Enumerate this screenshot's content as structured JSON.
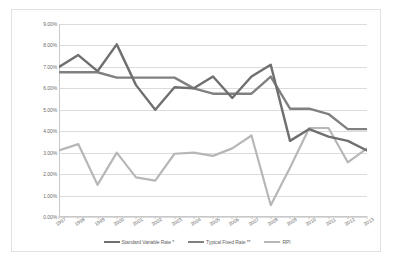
{
  "chart_data": {
    "type": "line",
    "title": "",
    "xlabel": "",
    "ylabel": "",
    "ylim": [
      0,
      9
    ],
    "ytick_labels": [
      "9.00%",
      "8.00%",
      "7.00%",
      "6.00%",
      "5.00%",
      "4.00%",
      "3.00%",
      "2.00%",
      "1.00%",
      "0.00%"
    ],
    "ytick_values": [
      9,
      8,
      7,
      6,
      5,
      4,
      3,
      2,
      1,
      0
    ],
    "grid": "horizontal",
    "legend_position": "bottom",
    "categories": [
      "1997",
      "1998",
      "1999",
      "2000",
      "2001",
      "2002",
      "2003",
      "2004",
      "2005",
      "2006",
      "2007",
      "2008",
      "2009",
      "2010",
      "2011",
      "2012",
      "2013"
    ],
    "series": [
      {
        "name": "Standard Variable Rate *",
        "color": "#6f6f6f",
        "values": [
          7.0,
          7.55,
          6.8,
          8.05,
          6.15,
          5.0,
          6.05,
          6.0,
          6.55,
          5.55,
          6.55,
          7.1,
          3.55,
          4.1,
          3.75,
          3.55,
          3.1
        ]
      },
      {
        "name": "Typical Fixed Rate **",
        "color": "#808080",
        "values": [
          6.75,
          6.75,
          6.75,
          6.5,
          6.5,
          6.5,
          6.5,
          6.0,
          5.75,
          5.75,
          5.75,
          6.55,
          5.05,
          5.05,
          4.8,
          4.1,
          4.1
        ]
      },
      {
        "name": "RPI",
        "color": "#b7b7b7",
        "values": [
          3.1,
          3.4,
          1.5,
          3.0,
          1.85,
          1.7,
          2.95,
          3.0,
          2.85,
          3.2,
          3.8,
          0.55,
          2.3,
          4.15,
          4.15,
          2.55,
          3.2
        ]
      }
    ]
  }
}
